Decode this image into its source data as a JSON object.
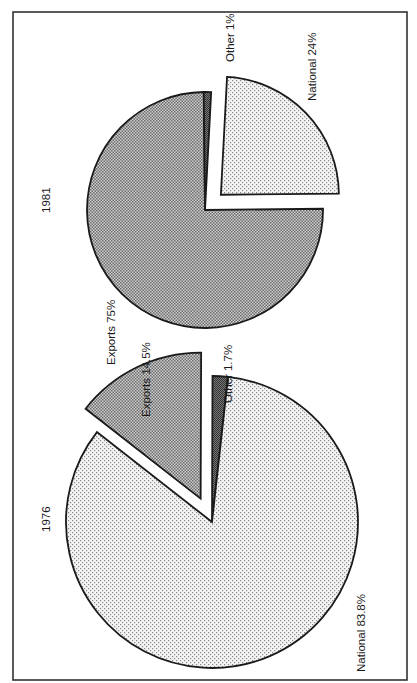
{
  "chart_data": [
    {
      "type": "pie",
      "title": "1976",
      "slices": [
        {
          "label": "National",
          "value": 83.8,
          "display": "National 83.8%",
          "pattern": "light"
        },
        {
          "label": "Exports",
          "value": 14.5,
          "display": "Exports 14.5%",
          "pattern": "dark",
          "exploded": true
        },
        {
          "label": "Other",
          "value": 1.7,
          "display": "Other 1.7%",
          "pattern": "darkest"
        }
      ]
    },
    {
      "type": "pie",
      "title": "1981",
      "slices": [
        {
          "label": "Exports",
          "value": 75,
          "display": "Exports 75%",
          "pattern": "dark"
        },
        {
          "label": "National",
          "value": 24,
          "display": "National 24%",
          "pattern": "light",
          "exploded": true
        },
        {
          "label": "Other",
          "value": 1,
          "display": "Other 1%",
          "pattern": "darkest"
        }
      ]
    }
  ],
  "orientation": "rotated-90-ccw",
  "colors": {
    "light": "#e6e6e6",
    "dark": "#a9a9a9",
    "darkest": "#555555",
    "ink": "#1a1a1a"
  }
}
